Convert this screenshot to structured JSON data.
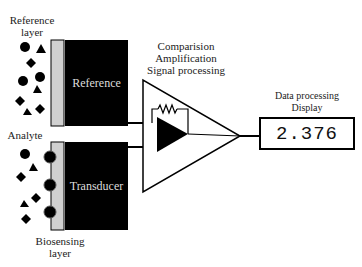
{
  "labels": {
    "reference_layer": [
      "Reference",
      "layer"
    ],
    "analyte": "Analyte",
    "biosensing_layer": [
      "Biosensing",
      "layer"
    ],
    "processing": [
      "Comparision",
      "Amplification",
      "Signal processing"
    ],
    "data_display": [
      "Data processing",
      "Display"
    ]
  },
  "blocks": {
    "reference": "Reference",
    "transducer": "Transducer"
  },
  "display": {
    "value": "2.376"
  },
  "colors": {
    "block_fill": "#000000",
    "layer_fill": "#d0d0d0",
    "line": "#000000"
  }
}
